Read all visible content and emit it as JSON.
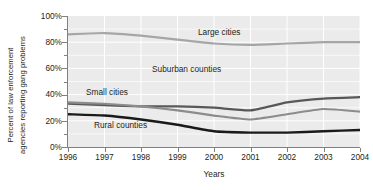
{
  "chart_data": {
    "type": "line",
    "title": "",
    "xlabel": "Years",
    "ylabel": "Percent of law enforcement agencies reporting gang problems",
    "ylabel_line1": "Percent of law enforcement",
    "ylabel_line2": "agencies reporting gang problems",
    "x": [
      1996,
      1997,
      1998,
      1999,
      2000,
      2001,
      2002,
      2003,
      2004
    ],
    "xticklabels": [
      "1996",
      "1997",
      "1998",
      "1999",
      "2000",
      "2001",
      "2002",
      "2003",
      "2004"
    ],
    "yticklabels": [
      "0%",
      "20%",
      "40%",
      "60%",
      "80%",
      "100%"
    ],
    "ytickvalues": [
      0,
      20,
      40,
      60,
      80,
      100
    ],
    "yminorticks": [
      10,
      30,
      50,
      70,
      90
    ],
    "ylim": [
      0,
      100
    ],
    "xlim": [
      1996,
      2004
    ],
    "grid": "white gridlines, light gray plot background",
    "legend": "in-plot series labels",
    "series": [
      {
        "name": "Large cities",
        "color": "#a6a6a6",
        "width": 2.2,
        "values": [
          86,
          87,
          85,
          82,
          79,
          78,
          79,
          80,
          80
        ],
        "label_x": 198,
        "label_y": 28
      },
      {
        "name": "Suburban counties",
        "color": "#585858",
        "width": 2.2,
        "values": [
          33,
          32,
          31,
          31,
          30,
          28,
          34,
          37,
          38
        ],
        "label_x": 152,
        "label_y": 65
      },
      {
        "name": "Small cities",
        "color": "#8c8c8c",
        "width": 2.2,
        "values": [
          34,
          33,
          31,
          28,
          24,
          21,
          25,
          29,
          27
        ],
        "label_x": 86,
        "label_y": 88
      },
      {
        "name": "Rural counties",
        "color": "#1a1a1a",
        "width": 2.4,
        "values": [
          25,
          24,
          21,
          17,
          12,
          11,
          11,
          12,
          13
        ],
        "label_x": 94,
        "label_y": 121
      }
    ]
  }
}
